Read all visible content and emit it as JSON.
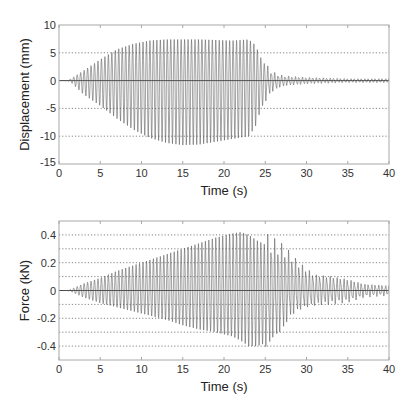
{
  "chart_data": [
    {
      "type": "line",
      "title": "",
      "xlabel": "Time (s)",
      "ylabel": "Displacement (mm)",
      "xlim": [
        0,
        40
      ],
      "ylim": [
        -15,
        10
      ],
      "xticks": [
        0,
        5,
        10,
        15,
        20,
        25,
        30,
        35,
        40
      ],
      "yticks": [
        -15,
        -10,
        -5,
        0,
        5,
        10
      ],
      "grid": "horizontal dotted",
      "legend": null,
      "frame": {
        "left": 59,
        "top": 25,
        "right": 389,
        "bottom": 164
      },
      "oscillation_period_s": 0.42,
      "envelope": {
        "t": [
          0,
          1.0,
          1.5,
          3,
          5,
          7,
          9,
          11,
          13,
          15,
          17,
          19,
          21,
          23,
          23.8,
          24.5,
          25.5,
          26.5,
          27.5,
          30,
          35,
          40
        ],
        "upper": [
          0,
          0,
          0.4,
          1.8,
          3.8,
          5.6,
          6.6,
          7.2,
          7.4,
          7.4,
          7.4,
          7.3,
          7.2,
          7.4,
          6.4,
          4.0,
          1.6,
          0.9,
          0.7,
          0.5,
          0.3,
          0.3
        ],
        "lower": [
          0,
          0,
          -0.4,
          -2.5,
          -4.5,
          -6.8,
          -8.8,
          -10.3,
          -11.2,
          -11.6,
          -11.5,
          -11.0,
          -10.5,
          -10.0,
          -8.3,
          -5.0,
          -2.2,
          -1.2,
          -0.8,
          -0.5,
          -0.3,
          -0.3
        ]
      }
    },
    {
      "type": "line",
      "title": "",
      "xlabel": "Time (s)",
      "ylabel": "Force (kN)",
      "xlim": [
        0,
        40
      ],
      "ylim": [
        -0.5,
        0.5
      ],
      "xticks": [
        0,
        5,
        10,
        15,
        20,
        25,
        30,
        35,
        40
      ],
      "yticks": [
        -0.4,
        -0.2,
        0,
        0.2,
        0.4
      ],
      "grid_lines": [
        -0.4,
        -0.3,
        -0.2,
        -0.1,
        0.1,
        0.2,
        0.3,
        0.4
      ],
      "grid": "horizontal dotted",
      "legend": null,
      "frame": {
        "left": 59,
        "top": 16,
        "right": 389,
        "bottom": 155
      },
      "oscillation_period_s": 0.42,
      "envelope": {
        "t": [
          0,
          1.0,
          1.5,
          3,
          5,
          7,
          9,
          11,
          13,
          15,
          17,
          19,
          21,
          22,
          23,
          24,
          25,
          26,
          27,
          28,
          29,
          30,
          31,
          33,
          35,
          37,
          40
        ],
        "upper": [
          0,
          0,
          0.01,
          0.05,
          0.09,
          0.14,
          0.18,
          0.22,
          0.26,
          0.3,
          0.34,
          0.38,
          0.41,
          0.42,
          0.4,
          0.36,
          0.33,
          0.31,
          0.28,
          0.24,
          0.18,
          0.14,
          0.1,
          0.09,
          0.07,
          0.04,
          0.03
        ],
        "lower": [
          0,
          0,
          -0.01,
          -0.05,
          -0.09,
          -0.12,
          -0.15,
          -0.18,
          -0.21,
          -0.25,
          -0.28,
          -0.3,
          -0.33,
          -0.36,
          -0.4,
          -0.4,
          -0.38,
          -0.3,
          -0.26,
          -0.16,
          -0.12,
          -0.1,
          -0.09,
          -0.08,
          -0.07,
          -0.04,
          -0.03
        ]
      }
    }
  ],
  "labels": {
    "top_xlabel": "Time (s)",
    "top_ylabel": "Displacement (mm)",
    "bottom_xlabel": "Time (s)",
    "bottom_ylabel": "Force (kN)"
  },
  "colors": {
    "signal": "#555555",
    "zero_line": "#333333",
    "grid": "#666666",
    "frame": "#a8a8a8",
    "text": "#222222"
  }
}
